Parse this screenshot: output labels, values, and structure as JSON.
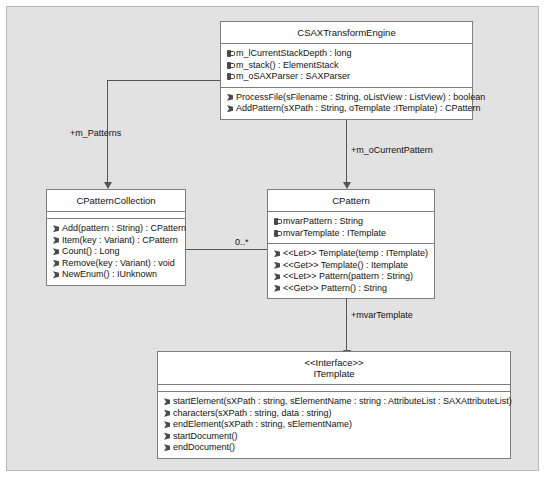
{
  "diagram": {
    "canvas_color": "#e2e2e2",
    "box_color": "#ffffff",
    "line_color": "#555555",
    "border_color": "#7d7d7d"
  },
  "classes": {
    "engine": {
      "name": "CSAXTransformEngine",
      "attributes": [
        {
          "vis": "private",
          "text": "m_lCurrentStackDepth : long"
        },
        {
          "vis": "private",
          "text": "m_stack() : ElementStack"
        },
        {
          "vis": "private",
          "text": "m_oSAXParser : SAXParser"
        }
      ],
      "operations": [
        {
          "vis": "public",
          "text": "ProcessFile(sFilename : String, oListView : ListView) : boolean"
        },
        {
          "vis": "public",
          "text": "AddPattern(sXPath : String, oTemplate :ITemplate) : CPattern"
        }
      ]
    },
    "collection": {
      "name": "CPatternCollection",
      "attributes": [],
      "operations": [
        {
          "vis": "public",
          "text": "Add(pattern : String) : CPattern"
        },
        {
          "vis": "public",
          "text": "Item(key : Variant) : CPattern"
        },
        {
          "vis": "public",
          "text": "Count() : Long"
        },
        {
          "vis": "public",
          "text": "Remove(key : Variant) : void"
        },
        {
          "vis": "public",
          "text": "NewEnum() : IUnknown"
        }
      ]
    },
    "pattern": {
      "name": "CPattern",
      "attributes": [
        {
          "vis": "private",
          "text": "mvarPattern : String"
        },
        {
          "vis": "private",
          "text": "mvarTemplate : ITemplate"
        }
      ],
      "operations": [
        {
          "vis": "public",
          "text": "<<Let>> Template(temp : ITemplate)"
        },
        {
          "vis": "public",
          "text": "<<Get>> Template() : Itemplate"
        },
        {
          "vis": "public",
          "text": "<<Let>> Pattern(pattern : String)"
        },
        {
          "vis": "public",
          "text": "<<Get>> Pattern() : String"
        }
      ]
    },
    "itemplate": {
      "stereotype": "<<Interface>>",
      "name": "ITemplate",
      "attributes": [],
      "operations": [
        {
          "vis": "public",
          "text": "startElement(sXPath : string, sElementName : string : AttributeList : SAXAttributeList)"
        },
        {
          "vis": "public",
          "text": "characters(sXPath : string, data : string)"
        },
        {
          "vis": "public",
          "text": "endElement(sXPath : string, sElementName)"
        },
        {
          "vis": "public",
          "text": "startDocument()"
        },
        {
          "vis": "public",
          "text": "endDocument()"
        }
      ]
    }
  },
  "connectors": {
    "engine_to_collection": {
      "label": "+m_Patterns"
    },
    "engine_to_pattern": {
      "label": "+m_oCurrentPattern"
    },
    "pattern_to_itemplate": {
      "label": "+mvarTemplate"
    },
    "collection_to_pattern": {
      "multiplicity": "0..*"
    }
  }
}
